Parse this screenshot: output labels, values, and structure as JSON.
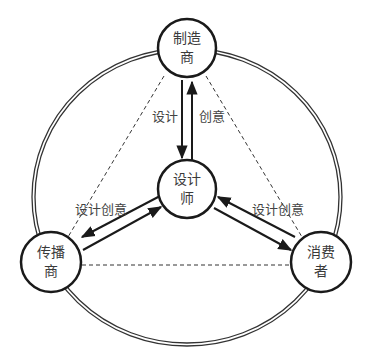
{
  "diagram": {
    "type": "relationship-cycle",
    "outer_ring": {
      "style": "double-line"
    },
    "nodes": [
      {
        "id": "manufacturer",
        "line1": "制造",
        "line2": "商"
      },
      {
        "id": "designer",
        "line1": "设计",
        "line2": "师"
      },
      {
        "id": "distributor",
        "line1": "传播",
        "line2": "商"
      },
      {
        "id": "consumer",
        "line1": "消费",
        "line2": "者"
      }
    ],
    "edges": [
      {
        "from": "manufacturer",
        "to": "designer",
        "label": "设计"
      },
      {
        "from": "designer",
        "to": "manufacturer",
        "label": "创意"
      },
      {
        "between": [
          "designer",
          "distributor"
        ],
        "label": "设计创意",
        "bidirectional": true
      },
      {
        "between": [
          "designer",
          "consumer"
        ],
        "label": "设计创意",
        "bidirectional": true
      },
      {
        "between": [
          "manufacturer",
          "distributor"
        ],
        "style": "dashed"
      },
      {
        "between": [
          "manufacturer",
          "consumer"
        ],
        "style": "dashed"
      },
      {
        "between": [
          "distributor",
          "consumer"
        ],
        "style": "dashed"
      }
    ],
    "colors": {
      "stroke": "#1a1a1a",
      "text": "#3a3a3a",
      "background": "#ffffff"
    }
  }
}
